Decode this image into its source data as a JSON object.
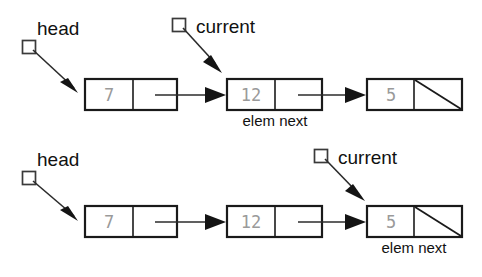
{
  "figure": {
    "background_color": "#ffffff",
    "line_color": "#1a1a1a",
    "value_color": "#9a9a9a",
    "label_color": "#111111"
  },
  "rows": [
    {
      "id": "row-top",
      "nodes": [
        {
          "elem": "7",
          "next_is_null": false
        },
        {
          "elem": "12",
          "next_is_null": false
        },
        {
          "elem": "5",
          "next_is_null": true
        }
      ],
      "pointers": [
        {
          "name": "head",
          "label": "head",
          "target_node_index": 0
        },
        {
          "name": "current",
          "label": "current",
          "target_node_index": 1
        }
      ],
      "caption": {
        "text": "elem next",
        "under_node_index": 1
      }
    },
    {
      "id": "row-bottom",
      "nodes": [
        {
          "elem": "7",
          "next_is_null": false
        },
        {
          "elem": "12",
          "next_is_null": false
        },
        {
          "elem": "5",
          "next_is_null": true
        }
      ],
      "pointers": [
        {
          "name": "head",
          "label": "head",
          "target_node_index": 0
        },
        {
          "name": "current",
          "label": "current",
          "target_node_index": 2
        }
      ],
      "caption": {
        "text": "elem next",
        "under_node_index": 2
      }
    }
  ],
  "labels": {
    "head_top": "head",
    "current_top": "current",
    "elem_next_top": "elem next",
    "head_bottom": "head",
    "current_bottom": "current",
    "elem_next_bottom": "elem next"
  },
  "values": {
    "top_node1": "7",
    "top_node2": "12",
    "top_node3": "5",
    "bottom_node1": "7",
    "bottom_node2": "12",
    "bottom_node3": "5"
  }
}
